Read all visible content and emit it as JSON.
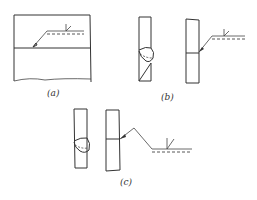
{
  "figure": {
    "parts": [
      {
        "id": "a",
        "label": "(a)",
        "description": "plate with horizontal joint line and weld symbol leader, reference line with dashed identification line and fillet/V weld symbol"
      },
      {
        "id": "b",
        "label": "(b)",
        "description": "two vertical bars: one with weld bead, one with arrow leader pointing to joint and reference line with dashed line and weld symbol"
      },
      {
        "id": "c",
        "label": "(c)",
        "description": "two vertical bars: one with weld bead, one with broken (cranked) leader to joint, reference line with dashed line and weld symbol"
      }
    ],
    "colors": {
      "line": "#333333",
      "background": "#ffffff"
    }
  }
}
